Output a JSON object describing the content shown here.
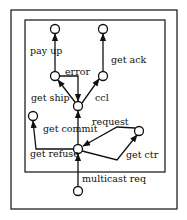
{
  "diagram": {
    "type": "state-machine",
    "outer_box": {
      "x": 11,
      "y": 10,
      "w": 166,
      "h": 199
    },
    "inner_box": {
      "x": 25,
      "y": 20,
      "w": 140,
      "h": 152
    },
    "nodes": [
      {
        "id": "n_payup",
        "x": 55,
        "y": 29
      },
      {
        "id": "n_ack",
        "x": 103,
        "y": 29
      },
      {
        "id": "n_ship",
        "x": 55,
        "y": 76
      },
      {
        "id": "n_ccl",
        "x": 103,
        "y": 76
      },
      {
        "id": "n_center",
        "x": 78,
        "y": 106
      },
      {
        "id": "n_commit",
        "x": 33,
        "y": 116
      },
      {
        "id": "n_ctr",
        "x": 139,
        "y": 131
      },
      {
        "id": "n_refuse",
        "x": 78,
        "y": 149
      },
      {
        "id": "n_start",
        "x": 78,
        "y": 191
      }
    ],
    "labels": {
      "pay_up": "pay up",
      "get_ack": "get ack",
      "error": "error",
      "get_ship": "get ship",
      "ccl": "ccl",
      "get_commit": "get commit",
      "request": "request",
      "get_refuse": "get refuse",
      "get_ctr": "get ctr",
      "multicast_req": "multicast req"
    }
  }
}
